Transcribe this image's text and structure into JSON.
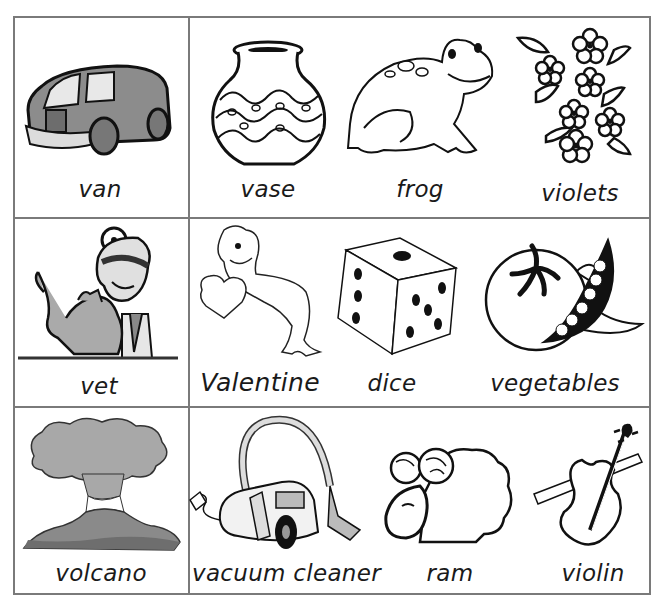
{
  "worksheet": {
    "theme": "letter v words",
    "rows": [
      {
        "cards": [
          {
            "word": "van",
            "icon": "van-icon"
          },
          {
            "word": "vase",
            "icon": "vase-icon"
          },
          {
            "word": "frog",
            "icon": "frog-icon"
          },
          {
            "word": "violets",
            "icon": "violets-icon"
          }
        ]
      },
      {
        "cards": [
          {
            "word": "vet",
            "icon": "vet-icon"
          },
          {
            "word": "Valentine",
            "icon": "valentine-icon"
          },
          {
            "word": "dice",
            "icon": "dice-icon"
          },
          {
            "word": "vegetables",
            "icon": "vegetables-icon"
          }
        ]
      },
      {
        "cards": [
          {
            "word": "volcano",
            "icon": "volcano-icon"
          },
          {
            "word": "vacuum cleaner",
            "icon": "vacuum-cleaner-icon"
          },
          {
            "word": "ram",
            "icon": "ram-icon"
          },
          {
            "word": "violin",
            "icon": "violin-icon"
          }
        ]
      }
    ],
    "colors": {
      "border": "#7a7a7a",
      "ink": "#1a1a1a",
      "shade": "#9a9a9a"
    }
  }
}
